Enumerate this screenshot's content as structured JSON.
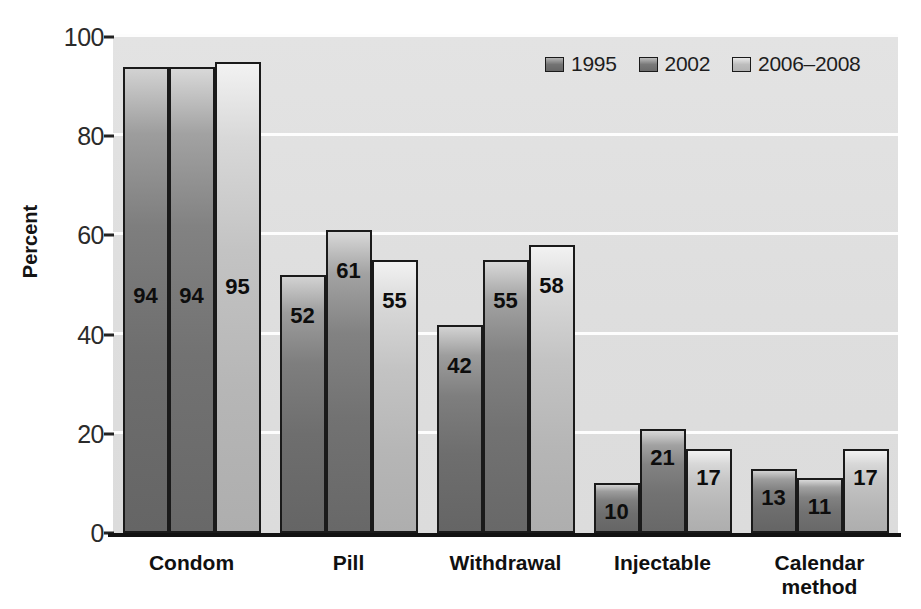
{
  "chart_data": {
    "type": "bar",
    "title": "",
    "subtitle": "",
    "xlabel": "",
    "ylabel": "Percent",
    "ylim": [
      0,
      100
    ],
    "yticks": [
      0,
      20,
      40,
      60,
      80,
      100
    ],
    "ytick_labels": [
      "0",
      "20",
      "40",
      "60",
      "80",
      "100"
    ],
    "grid": true,
    "legend_position": "top-right",
    "categories": [
      "Condom",
      "Pill",
      "Withdrawal",
      "Injectable",
      "Calendar method"
    ],
    "series": [
      {
        "name": "1995",
        "color": "#7a7a7a",
        "values": [
          94,
          52,
          42,
          10,
          13
        ]
      },
      {
        "name": "2002",
        "color": "#808080",
        "values": [
          94,
          61,
          55,
          21,
          11
        ]
      },
      {
        "name": "2006–2008",
        "color": "#c0c0c0",
        "values": [
          95,
          55,
          58,
          17,
          17
        ]
      }
    ],
    "value_labels": [
      [
        "94",
        "94",
        "95"
      ],
      [
        "52",
        "61",
        "55"
      ],
      [
        "42",
        "55",
        "58"
      ],
      [
        "10",
        "21",
        "17"
      ],
      [
        "13",
        "11",
        "17"
      ]
    ]
  },
  "axis": {
    "y_title": "Percent"
  },
  "categories_display": [
    {
      "line1": "Condom",
      "line2": ""
    },
    {
      "line1": "Pill",
      "line2": ""
    },
    {
      "line1": "Withdrawal",
      "line2": ""
    },
    {
      "line1": "Injectable",
      "line2": ""
    },
    {
      "line1": "Calendar",
      "line2": "method"
    }
  ],
  "legend": {
    "items": [
      {
        "label": "1995"
      },
      {
        "label": "2002"
      },
      {
        "label": "2006–2008"
      }
    ]
  },
  "colors": {
    "plot_background": "#dedede",
    "gridline": "#fdfdfd",
    "axis": "#121212",
    "text": "#101010"
  }
}
